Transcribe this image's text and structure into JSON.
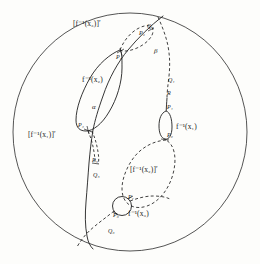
{
  "figure": {
    "name": "disk-with-preimage-curves",
    "background_color": "#fdfdfb",
    "ink_color": "#1a1a1a",
    "boundary": {
      "name": "outer-disk-boundary",
      "shape": "circle",
      "cx": 130,
      "cy": 132,
      "rx": 118,
      "ry": 120
    }
  },
  "labels": {
    "preimage_x3_prime": "[f⁻¹(x₃)]′",
    "preimage_x2": "f⁻¹(x₂)",
    "preimage_x1": "f⁻¹(x₁)",
    "preimage_x1_prime": "[f⁻¹(x₁)]′",
    "preimage_x2_prime": "[f⁻¹(x₂)]′",
    "preimage_x3": "f⁻¹(x₃)",
    "alpha": "α",
    "beta": "β"
  },
  "points": {
    "P0": "P₀",
    "P1": "P₁",
    "P2": "P₂",
    "P3": "P₃",
    "P4": "P₄",
    "P5": "P₅",
    "P6": "P₆",
    "P7": "P₇",
    "Q1": "Q₁",
    "Q2": "Q₂",
    "Q5": "Q₅",
    "Q6": "Q₆",
    "R": "R"
  }
}
